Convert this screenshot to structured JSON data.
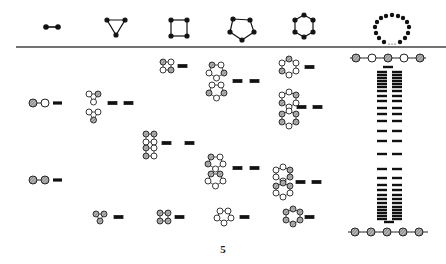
{
  "figure": {
    "page_number": "5",
    "header_graphs": [
      {
        "name": "dimer",
        "nodes": 2
      },
      {
        "name": "triangle",
        "nodes": 3
      },
      {
        "name": "square",
        "nodes": 4
      },
      {
        "name": "pentagon",
        "nodes": 5
      },
      {
        "name": "hexagon",
        "nodes": 6
      },
      {
        "name": "large-ring",
        "nodes": "N"
      }
    ],
    "columns": [
      {
        "ring": "2-site",
        "entries": [
          {
            "pattern": "shaded-open",
            "levels": 1,
            "y": 100
          },
          {
            "pattern": "shaded-shaded",
            "levels": 1,
            "y": 180
          }
        ]
      },
      {
        "ring": "3-site",
        "entries": [
          {
            "pattern": "open-open-shaded / open-open-shaded",
            "levels": 2,
            "y": 105
          },
          {
            "pattern": "all-shaded",
            "levels": 1,
            "y": 217
          }
        ]
      },
      {
        "ring": "4-site",
        "entries": [
          {
            "pattern": "alternating",
            "levels": 1,
            "y": 68
          },
          {
            "pattern": "two-shaded pairs",
            "levels": 2,
            "y": 143
          },
          {
            "pattern": "all-shaded",
            "levels": 1,
            "y": 217
          }
        ]
      },
      {
        "ring": "5-site",
        "entries": [
          {
            "pattern": "mixed pair",
            "levels": 2,
            "y": 82
          },
          {
            "pattern": "mixed pair",
            "levels": 2,
            "y": 167
          },
          {
            "pattern": "all-open",
            "levels": 1,
            "y": 217
          }
        ]
      },
      {
        "ring": "6-site",
        "entries": [
          {
            "pattern": "alternating",
            "levels": 1,
            "y": 68
          },
          {
            "pattern": "mixed pair",
            "levels": 2,
            "y": 106
          },
          {
            "pattern": "mixed pair",
            "levels": 2,
            "y": 181
          },
          {
            "pattern": "all-shaded",
            "levels": 1,
            "y": 217
          }
        ]
      },
      {
        "ring": "chain",
        "top_chain": "shaded-open-shaded-open-shaded",
        "bottom_chain": "all-shaded",
        "band_levels": "continuum"
      }
    ]
  }
}
